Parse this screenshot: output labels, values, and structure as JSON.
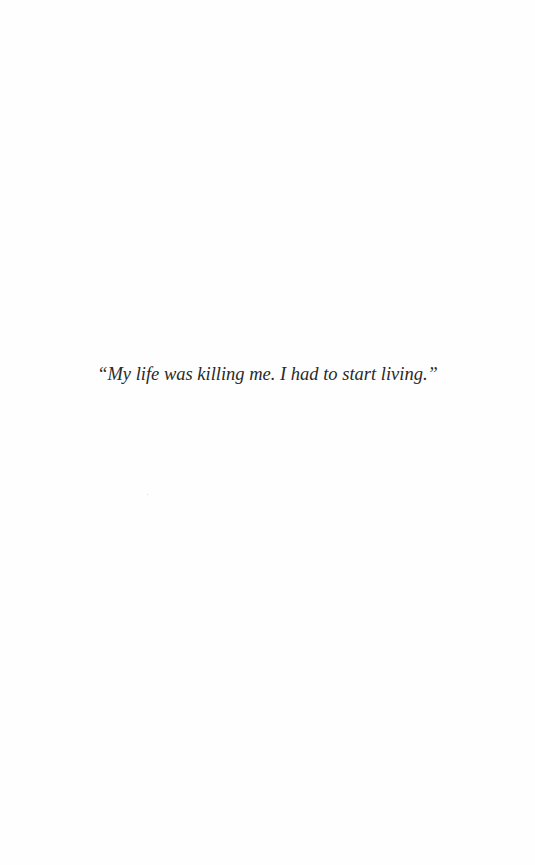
{
  "page": {
    "epigraph": "“My life was killing me. I had to start living.”"
  }
}
